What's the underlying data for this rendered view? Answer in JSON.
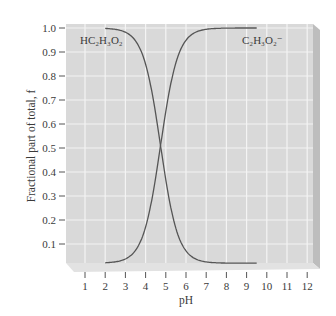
{
  "chart_data": {
    "type": "line",
    "title": "",
    "xlabel": "pH",
    "ylabel": "Fractional part of total, f",
    "xlim": [
      0.5,
      12.5
    ],
    "ylim": [
      0,
      1.0
    ],
    "x_ticks": [
      1,
      2,
      3,
      4,
      5,
      6,
      7,
      8,
      9,
      10,
      11,
      12
    ],
    "y_ticks": [
      "0.1",
      "0.2",
      "0.3",
      "0.4",
      "0.5",
      "0.6",
      "0.7",
      "0.8",
      "0.9",
      "1.0"
    ],
    "grid": true,
    "legend": "inline labels",
    "pKa": 4.74,
    "x": [
      2.0,
      2.5,
      3.0,
      3.5,
      4.0,
      4.5,
      4.74,
      5.0,
      5.5,
      6.0,
      6.5,
      7.0,
      7.5,
      8.0,
      8.5,
      9.0,
      9.5
    ],
    "series": [
      {
        "name": "HC2H3O2",
        "label_html": "HC₂H₃O₂",
        "values": [
          1.0,
          0.98,
          0.98,
          0.95,
          0.85,
          0.64,
          0.5,
          0.35,
          0.15,
          0.05,
          0.02,
          0.0,
          0.0,
          0.0,
          0.0,
          0.0,
          0.0
        ]
      },
      {
        "name": "C2H3O2-",
        "label_html": "C₂H₃O₂⁻",
        "values": [
          0.0,
          0.0,
          0.02,
          0.05,
          0.15,
          0.36,
          0.5,
          0.65,
          0.85,
          0.95,
          0.98,
          1.0,
          1.0,
          1.0,
          1.0,
          1.0,
          1.0
        ]
      }
    ]
  },
  "labels": {
    "series1": "HC₂H₃O₂",
    "series2": "C₂H₃O₂⁻",
    "xlabel": "pH",
    "ylabel": "Fractional part of total, f"
  },
  "colors": {
    "plot_bg": "#d9d9d9",
    "grid": "#f4f4f4",
    "curve": "#555555",
    "side_panel": "#bdbdbd",
    "ledge": "#e2e2e2"
  }
}
